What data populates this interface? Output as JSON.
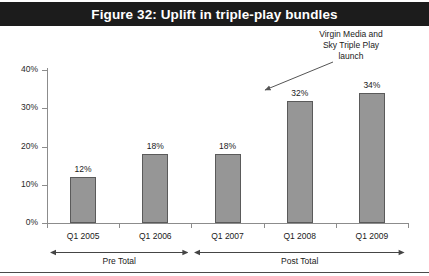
{
  "title": "Figure 32: Uplift in triple-play bundles",
  "annotation": {
    "line1": "Virgin Media and",
    "line2": "Sky Triple Play",
    "line3": "launch"
  },
  "groups": [
    {
      "label": "Pre Total"
    },
    {
      "label": "Post Total"
    }
  ],
  "colors": {
    "title_bar": "#1c1c1c",
    "title_text": "#ffffff",
    "bar_fill": "#969696",
    "bar_border": "#5a5a5a",
    "axis": "#8c8c8c",
    "background": "#ffffff"
  },
  "chart_data": {
    "type": "bar",
    "title": "Figure 32: Uplift in triple-play bundles",
    "xlabel": "",
    "ylabel": "",
    "categories": [
      "Q1 2005",
      "Q1 2006",
      "Q1 2007",
      "Q1 2008",
      "Q1 2009"
    ],
    "values": [
      12,
      18,
      18,
      32,
      34
    ],
    "value_labels": [
      "12%",
      "18%",
      "18%",
      "32%",
      "34%"
    ],
    "ylim": [
      0,
      40
    ],
    "ytick_values": [
      0,
      10,
      20,
      30,
      40
    ],
    "ytick_labels": [
      "0%",
      "10%",
      "20%",
      "30%",
      "40%"
    ],
    "grid": false,
    "legend": false,
    "annotations": [
      {
        "text": "Virgin Media and Sky Triple Play launch",
        "points_to_category": "Q1 2008"
      }
    ],
    "group_brackets": [
      {
        "label": "Pre Total",
        "categories": [
          "Q1 2005",
          "Q1 2006"
        ]
      },
      {
        "label": "Post Total",
        "categories": [
          "Q1 2007",
          "Q1 2008",
          "Q1 2009"
        ]
      }
    ]
  }
}
